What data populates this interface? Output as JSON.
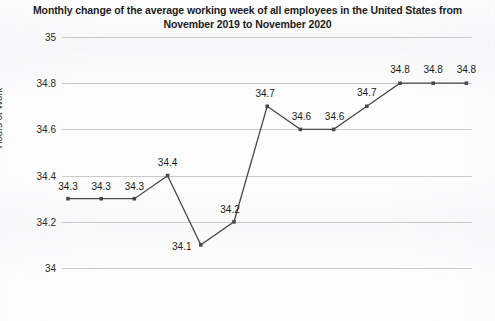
{
  "chart_data": {
    "type": "line",
    "title": "Monthly change of the average working week of all employees in the United States from November 2019 to November  2020",
    "xlabel": "",
    "ylabel": "Hours of Work",
    "ylim": [
      34,
      35
    ],
    "yticks": [
      "34",
      "34.2",
      "34.4",
      "34.6",
      "34.8",
      "35"
    ],
    "ytick_values": [
      34,
      34.2,
      34.4,
      34.6,
      34.8,
      35
    ],
    "grid": true,
    "legend": "none",
    "categories": [
      "Nov '19",
      "Dec '19",
      "Jan '20",
      "Feb '20",
      "Mar '20",
      "Apr '20",
      "May '20",
      "Jun '20",
      "Jul '20",
      "Aug '20",
      "Sep '20",
      "Oct '20*",
      "Nov '20*"
    ],
    "values": [
      34.3,
      34.3,
      34.3,
      34.4,
      34.1,
      34.2,
      34.7,
      34.6,
      34.6,
      34.7,
      34.8,
      34.8,
      34.8
    ],
    "point_labels": [
      "34.3",
      "34.3",
      "34.3",
      "34.4",
      "34.1",
      "34.2",
      "34.7",
      "34.6",
      "34.6",
      "34.7",
      "34.8",
      "34.8",
      "34.8"
    ],
    "series_color": "#4a4a4a",
    "grid_color": "#c9c9cb",
    "text_color": "#1c1c1c"
  }
}
